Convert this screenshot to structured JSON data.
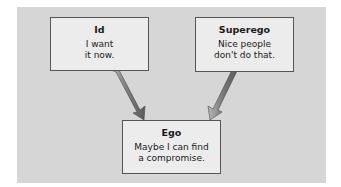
{
  "diagram": {
    "background_color": "#d6d6d6",
    "box_color": "#ececec",
    "arrow_color": "#8a8a8a",
    "nodes": [
      {
        "id": "id",
        "title": "Id",
        "text_line1": "I want",
        "text_line2": "it now."
      },
      {
        "id": "superego",
        "title": "Superego",
        "text_line1": "Nice people",
        "text_line2": "don't do that."
      },
      {
        "id": "ego",
        "title": "Ego",
        "text_line1": "Maybe I can find",
        "text_line2": "a compromise."
      }
    ],
    "edges": [
      {
        "from": "id",
        "to": "ego"
      },
      {
        "from": "superego",
        "to": "ego"
      }
    ]
  }
}
